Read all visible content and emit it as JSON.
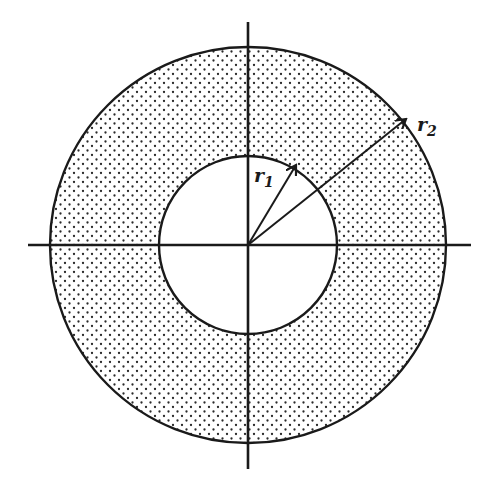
{
  "diagram": {
    "title": "",
    "type": "annulus",
    "center": {
      "x": 248,
      "y": 245
    },
    "inner_circle": {
      "radius": 89
    },
    "outer_circle": {
      "radius": 198
    },
    "axes": {
      "horizontal": {
        "x1": 28,
        "x2": 471,
        "y": 245
      },
      "vertical": {
        "x": 248,
        "y1": 22,
        "y2": 469
      }
    },
    "shading": "dotted",
    "colors": {
      "ink": "#1a1a1a",
      "background": "#ffffff",
      "dot": "#2a2a2a"
    },
    "labels": {
      "r1": {
        "base": "r",
        "sub": "1",
        "x": 254,
        "y": 182
      },
      "r2": {
        "base": "r",
        "sub": "2",
        "x": 417,
        "y": 131
      }
    },
    "arrows": {
      "r1": {
        "x2": 296,
        "y2": 165
      },
      "r2": {
        "x2": 406,
        "y2": 119
      }
    }
  }
}
